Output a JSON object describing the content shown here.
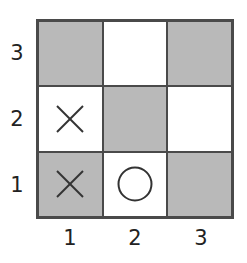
{
  "board": {
    "rows": 3,
    "cols": 3,
    "colors": {
      "dark": "#b9b9b9",
      "light": "#ffffff",
      "border": "#4a4a4a",
      "mark": "#333333"
    },
    "cells": [
      [
        {
          "row": 3,
          "col": 1,
          "shade": "dark",
          "mark": ""
        },
        {
          "row": 3,
          "col": 2,
          "shade": "light",
          "mark": ""
        },
        {
          "row": 3,
          "col": 3,
          "shade": "dark",
          "mark": ""
        }
      ],
      [
        {
          "row": 2,
          "col": 1,
          "shade": "light",
          "mark": "X"
        },
        {
          "row": 2,
          "col": 2,
          "shade": "dark",
          "mark": ""
        },
        {
          "row": 2,
          "col": 3,
          "shade": "light",
          "mark": ""
        }
      ],
      [
        {
          "row": 1,
          "col": 1,
          "shade": "dark",
          "mark": "X"
        },
        {
          "row": 1,
          "col": 2,
          "shade": "light",
          "mark": "O"
        },
        {
          "row": 1,
          "col": 3,
          "shade": "dark",
          "mark": ""
        }
      ]
    ]
  },
  "axes": {
    "y_labels": [
      "3",
      "2",
      "1"
    ],
    "x_labels": [
      "1",
      "2",
      "3"
    ]
  }
}
